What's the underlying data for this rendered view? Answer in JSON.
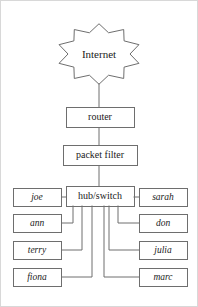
{
  "diagram": {
    "type": "network-topology",
    "cloud": {
      "label": "Internet",
      "shape": "starburst",
      "cx": 99,
      "cy": 54,
      "outer_r": 42,
      "inner_r": 31,
      "points": 10
    },
    "chain": [
      {
        "id": "router",
        "label": "router",
        "x": 66,
        "y": 107,
        "w": 68,
        "h": 20
      },
      {
        "id": "packet-filter",
        "label": "packet filter",
        "x": 63,
        "y": 145,
        "w": 74,
        "h": 20
      },
      {
        "id": "hub-switch",
        "label": "hub/switch",
        "x": 66,
        "y": 186,
        "w": 68,
        "h": 20
      }
    ],
    "left_hosts": [
      {
        "id": "joe",
        "label": "joe",
        "x": 13,
        "y": 188,
        "w": 48,
        "h": 18,
        "drop_x": 73,
        "elbow": false
      },
      {
        "id": "ann",
        "label": "ann",
        "x": 13,
        "y": 214,
        "w": 48,
        "h": 18,
        "drop_x": 73,
        "elbow": true
      },
      {
        "id": "terry",
        "label": "terry",
        "x": 13,
        "y": 241,
        "w": 48,
        "h": 18,
        "drop_x": 82,
        "elbow": true
      },
      {
        "id": "fiona",
        "label": "fiona",
        "x": 13,
        "y": 268,
        "w": 48,
        "h": 18,
        "drop_x": 92,
        "elbow": true
      }
    ],
    "right_hosts": [
      {
        "id": "sarah",
        "label": "sarah",
        "x": 139,
        "y": 188,
        "w": 48,
        "h": 18,
        "drop_x": 127,
        "elbow": false
      },
      {
        "id": "don",
        "label": "don",
        "x": 139,
        "y": 214,
        "w": 48,
        "h": 18,
        "drop_x": 118,
        "elbow": true
      },
      {
        "id": "julia",
        "label": "julia",
        "x": 139,
        "y": 241,
        "w": 48,
        "h": 18,
        "drop_x": 109,
        "elbow": true
      },
      {
        "id": "marc",
        "label": "marc",
        "x": 139,
        "y": 268,
        "w": 48,
        "h": 18,
        "drop_x": 104,
        "elbow": true
      }
    ],
    "trunk": {
      "cloud_to_router": {
        "x": 99,
        "y1": 84,
        "y2": 107
      },
      "router_to_filter": {
        "x": 99,
        "y1": 127,
        "y2": 145
      },
      "filter_to_hub": {
        "x": 99,
        "y1": 165,
        "y2": 186
      }
    },
    "colors": {
      "stroke": "#6e6e6e",
      "text": "#1b1b1b",
      "background": "#ffffff",
      "frame": "#d8d8d8"
    }
  }
}
